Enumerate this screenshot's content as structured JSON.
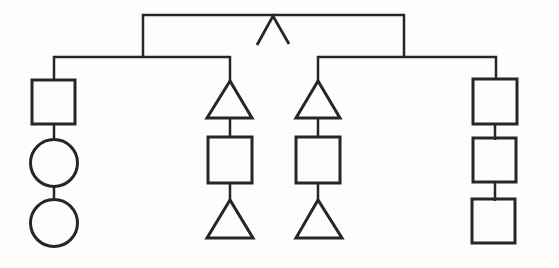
{
  "diagram": {
    "canvas": {
      "width": 559,
      "height": 268
    },
    "background_color": "#fdfdfc",
    "stroke_color": "#262626",
    "line_stroke_width": 2.5,
    "shape_stroke_width": 3,
    "root_mark": "caret",
    "branches": [
      {
        "id": "branch-1",
        "shapes": [
          "square",
          "circle",
          "circle"
        ]
      },
      {
        "id": "branch-2",
        "shapes": [
          "triangle",
          "square",
          "triangle"
        ]
      },
      {
        "id": "branch-3",
        "shapes": [
          "triangle",
          "square",
          "triangle"
        ]
      },
      {
        "id": "branch-4",
        "shapes": [
          "square",
          "square",
          "square"
        ]
      }
    ],
    "primitives": [
      {
        "name": "top-rail",
        "type": "line",
        "x1": 142,
        "y1": 15,
        "x2": 405,
        "y2": 15
      },
      {
        "name": "caret-mark",
        "type": "polyline",
        "points": "257,45 273,16 289,44",
        "sw": 2.8
      },
      {
        "name": "left-drop",
        "type": "line",
        "x1": 143,
        "y1": 14,
        "x2": 143,
        "y2": 58
      },
      {
        "name": "right-drop",
        "type": "line",
        "x1": 404,
        "y1": 14,
        "x2": 404,
        "y2": 58
      },
      {
        "name": "left-rail",
        "type": "line",
        "x1": 53,
        "y1": 57,
        "x2": 231,
        "y2": 57
      },
      {
        "name": "right-rail",
        "type": "line",
        "x1": 317,
        "y1": 57,
        "x2": 497,
        "y2": 57
      },
      {
        "name": "branch-1-stem",
        "type": "line",
        "x1": 54,
        "y1": 56,
        "x2": 54,
        "y2": 81
      },
      {
        "name": "branch-1-square",
        "type": "rect",
        "x": 32,
        "y": 80,
        "w": 43,
        "h": 44,
        "sw": 3
      },
      {
        "name": "branch-1-connector-1",
        "type": "line",
        "x1": 54,
        "y1": 124,
        "x2": 54,
        "y2": 141
      },
      {
        "name": "branch-1-circle-1",
        "type": "circle",
        "cx": 54,
        "cy": 163,
        "r": 23.5,
        "sw": 3
      },
      {
        "name": "branch-1-connector-2",
        "type": "line",
        "x1": 54,
        "y1": 186,
        "x2": 54,
        "y2": 201
      },
      {
        "name": "branch-1-circle-2",
        "type": "circle",
        "cx": 54,
        "cy": 223,
        "r": 23.5,
        "sw": 3
      },
      {
        "name": "branch-2-stem",
        "type": "line",
        "x1": 230,
        "y1": 56,
        "x2": 230,
        "y2": 84
      },
      {
        "name": "branch-2-triangle-1",
        "type": "polygon",
        "points": "230,81 207,118 252,118",
        "sw": 3
      },
      {
        "name": "branch-2-connector-1",
        "type": "line",
        "x1": 230,
        "y1": 118,
        "x2": 230,
        "y2": 138
      },
      {
        "name": "branch-2-square",
        "type": "rect",
        "x": 208,
        "y": 137,
        "w": 44,
        "h": 46,
        "sw": 3
      },
      {
        "name": "branch-2-connector-2",
        "type": "line",
        "x1": 230,
        "y1": 183,
        "x2": 230,
        "y2": 203
      },
      {
        "name": "branch-2-triangle-2",
        "type": "polygon",
        "points": "230,200 207,238 253,238",
        "sw": 3
      },
      {
        "name": "branch-3-stem",
        "type": "line",
        "x1": 318,
        "y1": 56,
        "x2": 318,
        "y2": 84
      },
      {
        "name": "branch-3-triangle-1",
        "type": "polygon",
        "points": "318,81 296,118 340,118",
        "sw": 3
      },
      {
        "name": "branch-3-connector-1",
        "type": "line",
        "x1": 318,
        "y1": 118,
        "x2": 318,
        "y2": 138
      },
      {
        "name": "branch-3-square",
        "type": "rect",
        "x": 296,
        "y": 137,
        "w": 44,
        "h": 46,
        "sw": 3
      },
      {
        "name": "branch-3-connector-2",
        "type": "line",
        "x1": 318,
        "y1": 183,
        "x2": 318,
        "y2": 203
      },
      {
        "name": "branch-3-triangle-2",
        "type": "polygon",
        "points": "318,200 296,238 342,238",
        "sw": 3
      },
      {
        "name": "branch-4-stem",
        "type": "line",
        "x1": 496,
        "y1": 56,
        "x2": 496,
        "y2": 80
      },
      {
        "name": "branch-4-square-1",
        "type": "rect",
        "x": 473,
        "y": 79,
        "w": 44,
        "h": 45,
        "sw": 3
      },
      {
        "name": "branch-4-connector-1",
        "type": "line",
        "x1": 495,
        "y1": 124,
        "x2": 495,
        "y2": 140
      },
      {
        "name": "branch-4-square-2",
        "type": "rect",
        "x": 473,
        "y": 138,
        "w": 43,
        "h": 44,
        "sw": 3
      },
      {
        "name": "branch-4-connector-2",
        "type": "line",
        "x1": 495,
        "y1": 182,
        "x2": 495,
        "y2": 201
      },
      {
        "name": "branch-4-square-3",
        "type": "rect",
        "x": 472,
        "y": 199,
        "w": 43,
        "h": 44,
        "sw": 3
      }
    ]
  }
}
